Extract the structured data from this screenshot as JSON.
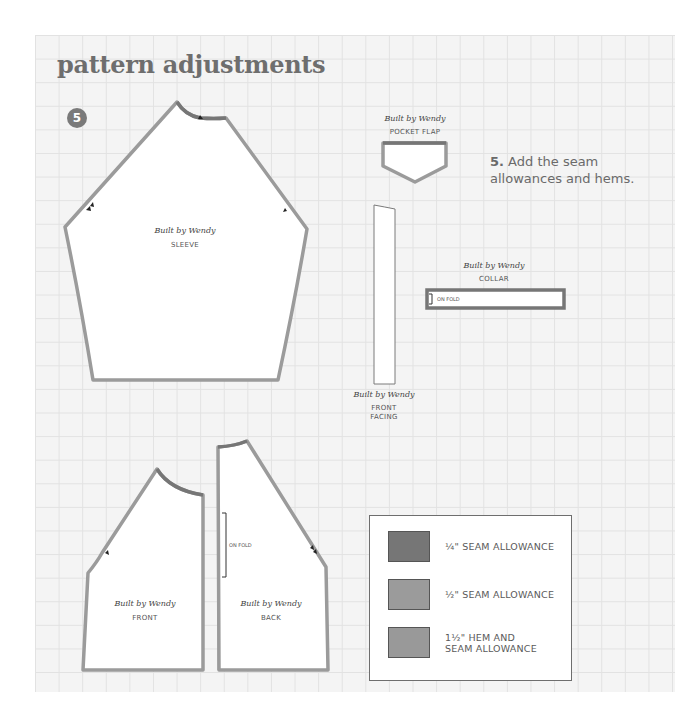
{
  "page": {
    "title": "pattern adjustments",
    "step_number": "5",
    "instruction": {
      "step_label": "5.",
      "text": " Add the seam allowances and hems."
    }
  },
  "pieces": {
    "brand_mark": "Built by Wendy",
    "sleeve": {
      "label": "SLEEVE"
    },
    "pocket_flap": {
      "label": "POCKET FLAP"
    },
    "front_facing": {
      "label_line1": "FRONT",
      "label_line2": "FACING"
    },
    "collar": {
      "label": "COLLAR",
      "fold_label": "ON FOLD"
    },
    "front": {
      "label": "FRONT"
    },
    "back": {
      "label": "BACK",
      "fold_label": "ON FOLD"
    }
  },
  "legend": {
    "items": [
      {
        "label": "¼\" SEAM ALLOWANCE",
        "color": "#767676"
      },
      {
        "label": "½\" SEAM ALLOWANCE",
        "color": "#9b9b9b"
      },
      {
        "label_line1": "1½\" HEM AND",
        "label_line2": "SEAM ALLOWANCE",
        "color": "#999999"
      }
    ]
  },
  "colors": {
    "grid_background": "#f4f4f4",
    "grid_line": "#e2e2e2",
    "quarter_inch_seam": "#767676",
    "half_inch_seam": "#9b9b9b",
    "hem_seam": "#999999",
    "title_text": "#6e6e6e"
  }
}
